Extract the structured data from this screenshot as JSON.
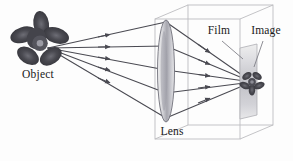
{
  "figure": {
    "background_color": "#fdfdfd",
    "width": 293,
    "height": 161
  },
  "labels": {
    "object": "Object",
    "lens": "Lens",
    "film": "Film",
    "image": "Image"
  },
  "colors": {
    "ray": "#4a4a52",
    "box_edge": "#b9b9bd",
    "lens_outline": "#6e6e76",
    "lens_fill_light": "#e4e4e6",
    "lens_fill_mid": "#a9a9b0",
    "film_light": "#ececee",
    "film_mid": "#bdbdc2",
    "flower_dark": "#3c3c42",
    "flower_mid": "#5a5a62",
    "text": "#1a1a1a",
    "leader": "#7a7a82"
  },
  "diagram": {
    "object_point": {
      "x": 48,
      "y": 48
    },
    "lens": {
      "cx": 166,
      "cy": 71,
      "rx": 8.5,
      "ry": 51
    },
    "film": {
      "x": 240,
      "y": 44,
      "width": 17,
      "height": 75
    },
    "focus_point": {
      "x": 252,
      "y": 82
    },
    "ray_count": 5,
    "lens_hit_points": [
      {
        "x": 166,
        "y": 22
      },
      {
        "x": 166,
        "y": 46
      },
      {
        "x": 166,
        "y": 70
      },
      {
        "x": 166,
        "y": 93
      },
      {
        "x": 166,
        "y": 118
      }
    ]
  },
  "leaders": {
    "film": {
      "x1": 222,
      "y1": 40,
      "x2": 243,
      "y2": 58
    },
    "image": {
      "x1": 264,
      "y1": 40,
      "x2": 254,
      "y2": 66
    }
  }
}
